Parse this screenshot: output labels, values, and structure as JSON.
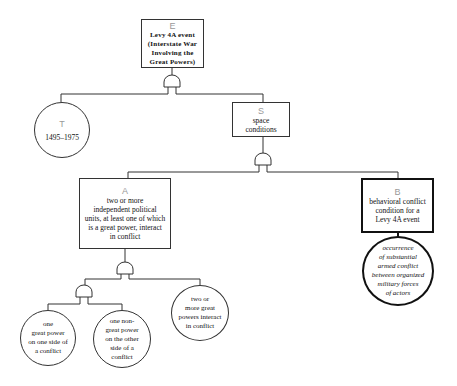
{
  "diagram": {
    "type": "fault-tree",
    "nodes": {
      "E": {
        "letter": "E",
        "text": "Levy 4A event\n(Interstate War\nInvolving the\nGreat Powers)",
        "shape": "rectangle"
      },
      "T": {
        "letter": "T",
        "text": "1495–1975",
        "shape": "circle"
      },
      "S": {
        "letter": "S",
        "text": "space\nconditions",
        "shape": "rectangle"
      },
      "A": {
        "letter": "A",
        "text": "two or more\nindependent political\nunits, at least one of which\nis a great power, interact\nin conflict",
        "shape": "rectangle"
      },
      "B": {
        "letter": "B",
        "text": "behavioral conflict\ncondition for a\nLevy 4A event",
        "shape": "rectangle-thick"
      },
      "B1": {
        "text": "occurrence\nof substantial\narmed conflict\nbetween organized\nmilitary forces\nof actors",
        "shape": "circle-thick"
      },
      "A1": {
        "text": "one\ngreat power\non one side of\na conflict",
        "shape": "circle"
      },
      "A2": {
        "text": "one non-\ngreat power\non the other\nside of a\nconflict",
        "shape": "circle"
      },
      "A3": {
        "text": "two or\nmore great\npowers interact\nin conflict",
        "shape": "circle"
      }
    },
    "gates": [
      {
        "type": "AND",
        "parent": "E",
        "children": [
          "T",
          "S"
        ]
      },
      {
        "type": "AND",
        "parent": "S",
        "children": [
          "A",
          "B"
        ]
      },
      {
        "type": "AND",
        "parent": "A",
        "children": [
          "AND-sub",
          "A3"
        ]
      },
      {
        "type": "AND",
        "parent": "AND-sub",
        "children": [
          "A1",
          "A2"
        ]
      }
    ],
    "edges": [
      [
        "B",
        "B1"
      ]
    ]
  }
}
